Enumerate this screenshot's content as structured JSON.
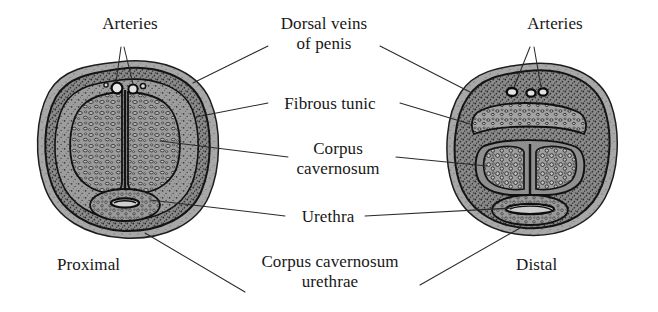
{
  "figure": {
    "background_color": "#ffffff",
    "ink_color": "#171717",
    "tissue_gray": "#9a9a9a",
    "tunic_gray": "#6e6e6e"
  },
  "labels": {
    "arteries_left": "Arteries",
    "arteries_right": "Arteries",
    "dorsal_veins_line1": "Dorsal veins",
    "dorsal_veins_line2": "of penis",
    "fibrous_tunic": "Fibrous tunic",
    "corpus_cavernosum_line1": "Corpus",
    "corpus_cavernosum_line2": "cavernosum",
    "urethra": "Urethra",
    "corpus_cavernosum_urethrae_line1": "Corpus cavernosum",
    "corpus_cavernosum_urethrae_line2": "urethrae",
    "proximal": "Proximal",
    "distal": "Distal"
  },
  "sections": {
    "left": {
      "name": "Proximal section"
    },
    "right": {
      "name": "Distal section"
    }
  }
}
